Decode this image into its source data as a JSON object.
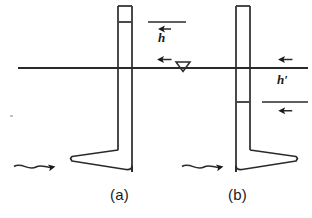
{
  "figure": {
    "type": "engineering-diagram",
    "background_color": "#ffffff",
    "line_color": "#2a2a2a",
    "width": 312,
    "height": 218
  },
  "water_line": {
    "name": "water-surface-line",
    "x1": 18,
    "x2": 308,
    "y": 68,
    "marker_symbol": "▽",
    "marker_x": 182,
    "marker_y": 62
  },
  "panels": [
    {
      "id": "a",
      "label": "(a)",
      "label_x": 118,
      "label_y": 188,
      "tube": {
        "x_left": 118,
        "x_right": 132,
        "y_top": 6,
        "y_bottom": 172,
        "inner_level_y": 22,
        "foot_direction": "left",
        "foot_x_outer": 68,
        "foot_y": 158
      },
      "flow_arrow": {
        "name": "flow-arrow-a",
        "x_start": 14,
        "x_end": 60,
        "y": 166
      },
      "dimension": {
        "symbol": "h",
        "label_x": 162,
        "label_y": 38,
        "line_x": 166,
        "y_top": 22,
        "y_bottom": 68,
        "tick_x1": 148,
        "tick_x2": 186,
        "position": "above-water-line"
      }
    },
    {
      "id": "b",
      "label": "(b)",
      "label_x": 236,
      "label_y": 188,
      "tube": {
        "x_left": 236,
        "x_right": 250,
        "y_top": 6,
        "y_bottom": 172,
        "inner_level_y": 102,
        "foot_direction": "right",
        "foot_x_outer": 300,
        "foot_y": 158
      },
      "flow_arrow": {
        "name": "flow-arrow-b",
        "x_start": 182,
        "x_end": 228,
        "y": 166
      },
      "dimension": {
        "symbol": "h′",
        "label_x": 281,
        "label_y": 80,
        "line_x": 287,
        "y_top": 68,
        "y_bottom": 102,
        "tick_x1": 262,
        "tick_x2": 308,
        "position": "below-water-line"
      }
    }
  ],
  "artifact": {
    "name": "scan-speck",
    "x": 10,
    "y": 115
  }
}
